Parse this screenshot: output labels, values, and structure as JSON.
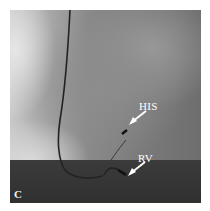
{
  "figure": {
    "panel_letter": "C",
    "image_type": "fluoroscopy",
    "annotations": [
      {
        "label": "HIS",
        "x": 139,
        "y": 106
      },
      {
        "label": "RV",
        "x": 137,
        "y": 156
      }
    ],
    "colors": {
      "annotation": "#ffffff",
      "catheter": "#1e1e1e",
      "diaphragm": "#333333"
    }
  }
}
